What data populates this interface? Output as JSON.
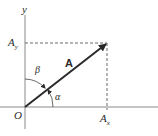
{
  "diagram": {
    "title": "",
    "labels": {
      "y_axis": "y",
      "origin": "O",
      "vector": "A",
      "ay_main": "A",
      "ay_sub": "y",
      "ax_main": "A",
      "ax_sub": "x",
      "alpha": "α",
      "beta": "β"
    },
    "colors": {
      "axis": "#8a8a8a",
      "vector": "#2a2a2a",
      "dashed": "#6a6a6a",
      "text": "#2a2a2a"
    }
  }
}
